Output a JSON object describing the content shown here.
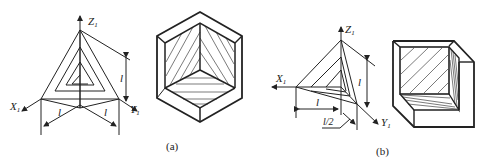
{
  "figure_a": {
    "caption": "(a)",
    "axes": {
      "x": "X",
      "y": "Y",
      "z": "Z",
      "subscript": "1"
    },
    "dimensions": {
      "left": "l",
      "right": "l",
      "vertical": "l"
    }
  },
  "figure_b": {
    "caption": "(b)",
    "axes": {
      "x": "X",
      "y": "Y",
      "z": "Z",
      "subscript": "1"
    },
    "dimensions": {
      "horizontal": "l",
      "depth": "l/2",
      "vertical": "l"
    }
  },
  "colors": {
    "line": "#222222",
    "background": "#ffffff"
  }
}
